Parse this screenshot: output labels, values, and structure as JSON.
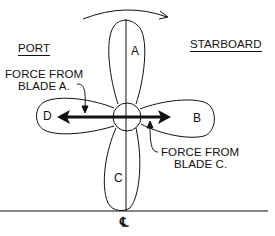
{
  "diagram": {
    "type": "propeller-force-diagram",
    "labels": {
      "port": "PORT",
      "starboard": "STARBOARD",
      "force_a_line1": "FORCE FROM",
      "force_a_line2": "BLADE A.",
      "force_c_line1": "FORCE FROM",
      "force_c_line2": "BLADE C.",
      "centerline": "℄"
    },
    "blades": [
      {
        "id": "A",
        "label": "A",
        "position": "top"
      },
      {
        "id": "B",
        "label": "B",
        "position": "right"
      },
      {
        "id": "C",
        "label": "C",
        "position": "bottom"
      },
      {
        "id": "D",
        "label": "D",
        "position": "left"
      }
    ],
    "rotation": "clockwise",
    "colors": {
      "line": "#111111",
      "background": "#ffffff"
    }
  }
}
